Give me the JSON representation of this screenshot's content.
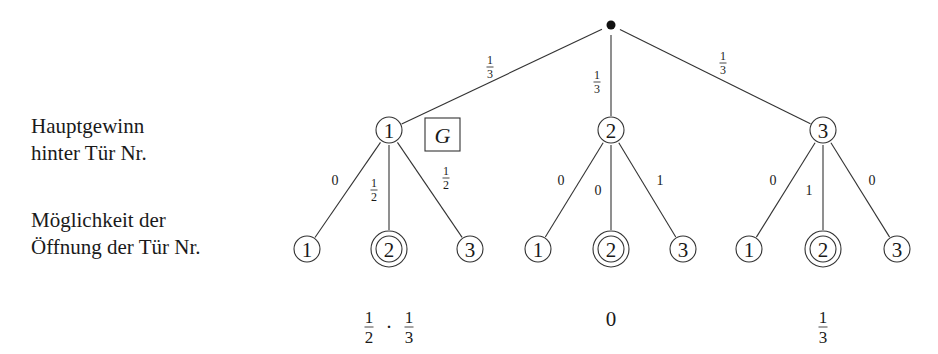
{
  "labels": {
    "level1_line1": "Hauptgewinn",
    "level1_line2": "hinter Tür Nr.",
    "level2_line1": "Möglichkeit der",
    "level2_line2": "Öffnung der Tür Nr."
  },
  "tree": {
    "root": {
      "x": 611,
      "y": 25,
      "r": 4.5
    },
    "level1": [
      {
        "label": "1",
        "x": 389,
        "y": 130,
        "edge_label": {
          "num": "1",
          "den": "3",
          "x": 490,
          "y": 67
        }
      },
      {
        "label": "2",
        "x": 611,
        "y": 130,
        "edge_label": {
          "num": "1",
          "den": "3",
          "x": 597,
          "y": 82
        }
      },
      {
        "label": "3",
        "x": 823,
        "y": 130,
        "edge_label": {
          "num": "1",
          "den": "3",
          "x": 723,
          "y": 63
        }
      }
    ],
    "node_radius": 13,
    "marker": {
      "text": "G",
      "x": 425,
      "y": 118,
      "w": 35,
      "h": 33
    },
    "level2": [
      {
        "parent": 0,
        "children": [
          {
            "label": "1",
            "x": 307,
            "y": 249,
            "double": false,
            "edge_label": {
              "text": "0",
              "x": 335,
              "y": 180
            }
          },
          {
            "label": "2",
            "x": 389,
            "y": 249,
            "double": true,
            "edge_label": {
              "num": "1",
              "den": "2",
              "x": 374,
              "y": 190
            }
          },
          {
            "label": "3",
            "x": 470,
            "y": 249,
            "double": false,
            "edge_label": {
              "num": "1",
              "den": "2",
              "x": 446,
              "y": 178
            }
          }
        ]
      },
      {
        "parent": 1,
        "children": [
          {
            "label": "1",
            "x": 538,
            "y": 249,
            "double": false,
            "edge_label": {
              "text": "0",
              "x": 561,
              "y": 180
            }
          },
          {
            "label": "2",
            "x": 611,
            "y": 249,
            "double": true,
            "edge_label": {
              "text": "0",
              "x": 598,
              "y": 190
            }
          },
          {
            "label": "3",
            "x": 683,
            "y": 249,
            "double": false,
            "edge_label": {
              "text": "1",
              "x": 660,
              "y": 180
            }
          }
        ]
      },
      {
        "parent": 2,
        "children": [
          {
            "label": "1",
            "x": 749,
            "y": 249,
            "double": false,
            "edge_label": {
              "text": "0",
              "x": 773,
              "y": 180
            }
          },
          {
            "label": "2",
            "x": 823,
            "y": 249,
            "double": true,
            "edge_label": {
              "text": "1",
              "x": 809,
              "y": 190
            }
          },
          {
            "label": "3",
            "x": 897,
            "y": 249,
            "double": false,
            "edge_label": {
              "text": "0",
              "x": 872,
              "y": 180
            }
          }
        ]
      }
    ],
    "results": [
      {
        "type": "product",
        "x": 389,
        "y": 327,
        "a": {
          "num": "1",
          "den": "2"
        },
        "b": {
          "num": "1",
          "den": "3"
        },
        "op": "·"
      },
      {
        "type": "text",
        "x": 611,
        "y": 319,
        "text": "0"
      },
      {
        "type": "fraction",
        "x": 823,
        "y": 327,
        "num": "1",
        "den": "3"
      }
    ]
  },
  "colors": {
    "line": "#333333",
    "text": "#1a1a1a",
    "background": "#ffffff"
  }
}
